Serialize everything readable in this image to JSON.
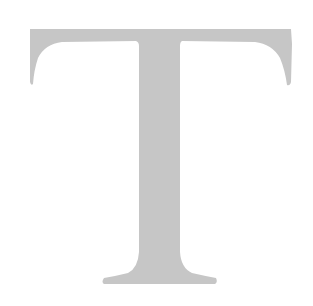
{
  "glyph": {
    "character": "T",
    "fill_color": "#c6c6c6",
    "background_color": "#ffffff"
  }
}
